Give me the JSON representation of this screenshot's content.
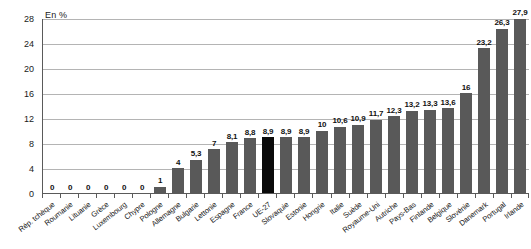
{
  "axis_unit_label": "En %",
  "colors": {
    "bar": "#595959",
    "highlight_bar": "#0a0a0a",
    "grid": "#b4b4b4",
    "axis": "#5a5a5a",
    "text": "#1a1a1a"
  },
  "highlight_category": "UE-27",
  "chart_data": {
    "type": "bar",
    "title": "",
    "subtitle": "",
    "xlabel": "",
    "ylabel": "En %",
    "ylim": [
      0,
      28
    ],
    "yticks": [
      0,
      4,
      8,
      12,
      16,
      20,
      24,
      28
    ],
    "ytick_labels": [
      "0",
      "4",
      "8",
      "12",
      "16",
      "20",
      "24",
      "28"
    ],
    "grid": true,
    "legend": false,
    "legend_position": "none",
    "categories": [
      "Rép. tchèque",
      "Roumanie",
      "Lituanie",
      "Grèce",
      "Luxembourg",
      "Chypre",
      "Pologne",
      "Allemagne",
      "Bulgarie",
      "Lettonie",
      "Espagne",
      "France",
      "UE-27",
      "Slovaquie",
      "Estonie",
      "Hongrie",
      "Italie",
      "Suède",
      "Royaume-Uni",
      "Autriche",
      "Pays-Bas",
      "Finlande",
      "Belgique",
      "Slovénie",
      "Danemark",
      "Portugal",
      "Irlande"
    ],
    "values": [
      0,
      0,
      0,
      0,
      0,
      0,
      1,
      4,
      5.3,
      7,
      8.1,
      8.8,
      8.9,
      8.9,
      8.9,
      10,
      10.6,
      10.9,
      11.7,
      12.3,
      13.2,
      13.3,
      13.6,
      16,
      23.2,
      26.3,
      27.9
    ],
    "value_labels": [
      "0",
      "0",
      "0",
      "0",
      "0",
      "0",
      "1",
      "4",
      "5,3",
      "7",
      "8,1",
      "8,8",
      "8,9",
      "8,9",
      "8,9",
      "10",
      "10,6",
      "10,9",
      "11,7",
      "12,3",
      "13,2",
      "13,3",
      "13,6",
      "16",
      "23,2",
      "26,3",
      "27,9"
    ]
  }
}
